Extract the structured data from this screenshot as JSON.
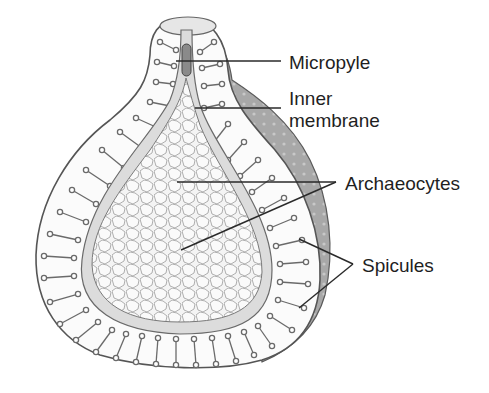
{
  "diagram": {
    "labels": {
      "micropyle": "Micropyle",
      "inner_membrane_line1": "Inner",
      "inner_membrane_line2": "membrane",
      "archaeocytes": "Archaeocytes",
      "spicules": "Spicules"
    },
    "colors": {
      "background": "#ffffff",
      "outline": "#4a4a4a",
      "shell_shadow": "#9a9a9a",
      "membrane": "#d8d8d8",
      "cells_fill": "#f2f2f2",
      "leader_line": "#2a2a2a"
    }
  }
}
